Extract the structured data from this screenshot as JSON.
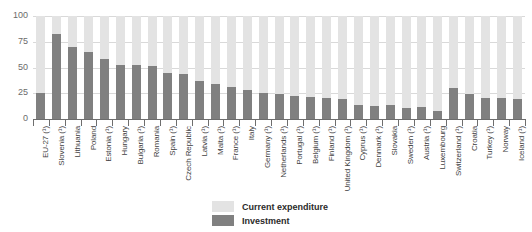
{
  "chart_data": {
    "type": "bar",
    "title": "",
    "subtitle": "",
    "xlabel": "",
    "ylabel": "",
    "ylim": [
      0,
      100
    ],
    "yticks": [
      "0",
      "25",
      "50",
      "75",
      "100"
    ],
    "grid": true,
    "stacked": true,
    "stacked_total": 100,
    "legend_position": "bottom-center",
    "categories": [
      "EU-27 (¹)",
      "Slovenia (¹)",
      "Lithuania",
      "Poland",
      "Estonia (¹)",
      "Hungary",
      "Bulgaria (¹)",
      "Romania",
      "Spain (¹)",
      "Czech Republic",
      "Latvia (¹)",
      "Malta (¹)",
      "France (¹)",
      "Italy",
      "Germany (¹)",
      "Netherlands (¹)",
      "Portugal (¹)",
      "Belgium (¹)",
      "Finland (¹)",
      "United Kingdom (¹)",
      "Cyprus (¹)",
      "Denmark (¹)",
      "Slovakia",
      "Sweden (¹)",
      "Austria (¹)",
      "Luxembourg",
      "Switzerland (¹)",
      "Croatia",
      "Turkey (¹)",
      "Norway",
      "Iceland (¹)"
    ],
    "series": [
      {
        "name": "Investment",
        "color": "#808080",
        "values": [
          25,
          83,
          70,
          65,
          58,
          52,
          52,
          51,
          45,
          44,
          37,
          34,
          31,
          28,
          25,
          24,
          22,
          21,
          20,
          19,
          14,
          13,
          14,
          11,
          12,
          8,
          30,
          24,
          20,
          20,
          19
        ]
      },
      {
        "name": "Current expenditure",
        "color": "#e3e3e3",
        "values": [
          75,
          17,
          30,
          35,
          42,
          48,
          48,
          49,
          55,
          56,
          63,
          66,
          69,
          72,
          75,
          76,
          78,
          79,
          80,
          81,
          86,
          87,
          86,
          89,
          88,
          92,
          70,
          76,
          80,
          80,
          81
        ]
      }
    ]
  },
  "legend": {
    "items": [
      {
        "label": "Current expenditure",
        "color": "#e3e3e3"
      },
      {
        "label": "Investment",
        "color": "#808080"
      }
    ]
  }
}
